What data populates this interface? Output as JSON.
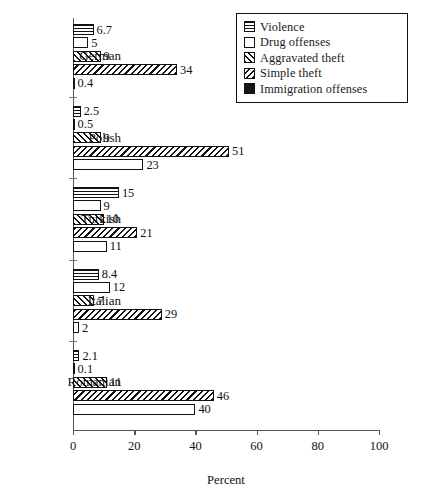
{
  "chart_data": {
    "type": "bar",
    "orientation": "horizontal",
    "title": "",
    "xlabel": "Percent",
    "ylabel": "",
    "xlim": [
      0,
      100
    ],
    "xticks": [
      0,
      20,
      40,
      60,
      80,
      100
    ],
    "grid": false,
    "legend_position": "top-right",
    "categories": [
      "German",
      "Polish",
      "Turkish",
      "Italian",
      "Romanian"
    ],
    "series": [
      {
        "name": "Violence",
        "pattern": "horizontal-lines",
        "values": [
          6.7,
          2.5,
          15,
          8.4,
          2.1
        ]
      },
      {
        "name": "Drug offenses",
        "pattern": "white",
        "values": [
          5,
          0.5,
          9,
          12,
          0.1
        ]
      },
      {
        "name": "Aggravated theft",
        "pattern": "forward-diagonal",
        "values": [
          9,
          9,
          10,
          7,
          11
        ]
      },
      {
        "name": "Simple theft",
        "pattern": "back-diagonal",
        "values": [
          34,
          51,
          21,
          29,
          46
        ]
      },
      {
        "name": "Immigration offenses",
        "pattern": "solid-black",
        "values": [
          0.4,
          23,
          11,
          2,
          40
        ]
      }
    ],
    "value_labels": {
      "German": [
        "6.7",
        "5",
        "9",
        "34",
        "0.4"
      ],
      "Polish": [
        "2.5",
        "0.5",
        "9",
        "51",
        "23"
      ],
      "Turkish": [
        "15",
        "9",
        "10",
        "21",
        "11"
      ],
      "Italian": [
        "8.4",
        "12",
        "7",
        "29",
        "2"
      ],
      "Romanian": [
        "2.1",
        "0.1",
        "11",
        "46",
        "40"
      ]
    }
  },
  "legend": {
    "items": [
      {
        "label": "Violence"
      },
      {
        "label": "Drug offenses"
      },
      {
        "label": "Aggravated theft"
      },
      {
        "label": "Simple theft"
      },
      {
        "label": "Immigration offenses"
      }
    ]
  },
  "axis": {
    "x_title": "Percent",
    "x_tick_labels": [
      "0",
      "20",
      "40",
      "60",
      "80",
      "100"
    ],
    "y_tick_labels": [
      "German",
      "Polish",
      "Turkish",
      "Italian",
      "Romanian"
    ]
  }
}
